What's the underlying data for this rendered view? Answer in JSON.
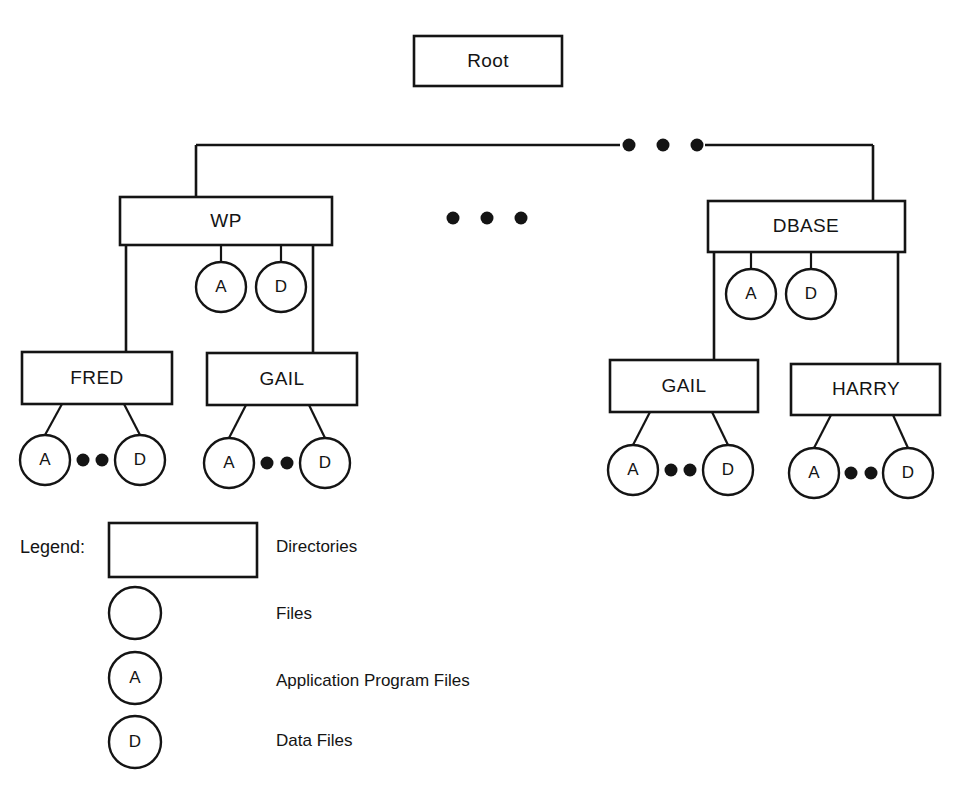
{
  "diagram": {
    "colors": {
      "stroke": "#141414",
      "fill": "#ffffff",
      "background": "#ffffff",
      "text": "#141414"
    },
    "root": {
      "label": "Root"
    },
    "level1": [
      {
        "label": "WP",
        "files": [
          "A",
          "D"
        ]
      },
      {
        "label": "DBASE",
        "files": [
          "A",
          "D"
        ]
      }
    ],
    "level2": [
      {
        "label": "FRED",
        "parent": "WP",
        "files": [
          "A",
          "D"
        ]
      },
      {
        "label": "GAIL",
        "parent": "WP",
        "files": [
          "A",
          "D"
        ]
      },
      {
        "label": "GAIL",
        "parent": "DBASE",
        "files": [
          "A",
          "D"
        ]
      },
      {
        "label": "HARRY",
        "parent": "DBASE",
        "files": [
          "A",
          "D"
        ]
      }
    ],
    "ellipses": {
      "top_connector_dots": 3,
      "mid_row_dots": 3,
      "between_files_dots": 2
    }
  },
  "legend": {
    "title": "Legend:",
    "items": [
      {
        "shape": "rectangle",
        "glyph": "",
        "label": "Directories"
      },
      {
        "shape": "circle",
        "glyph": "",
        "label": "Files"
      },
      {
        "shape": "circle",
        "glyph": "A",
        "label": "Application Program Files"
      },
      {
        "shape": "circle",
        "glyph": "D",
        "label": "Data Files"
      }
    ]
  }
}
